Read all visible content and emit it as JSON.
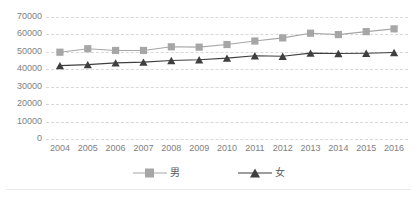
{
  "chart_data": {
    "type": "line",
    "title": "",
    "subtitle": "",
    "xlabel": "",
    "ylabel": "",
    "categories": [
      "2004",
      "2005",
      "2006",
      "2007",
      "2008",
      "2009",
      "2010",
      "2011",
      "2012",
      "2013",
      "2014",
      "2015",
      "2016"
    ],
    "series": [
      {
        "name": "男",
        "color": "#a6a6a6",
        "marker": "square",
        "values": [
          49800,
          51800,
          50800,
          50800,
          52900,
          52700,
          54200,
          56200,
          58000,
          60700,
          59900,
          61600,
          63200
        ]
      },
      {
        "name": "女",
        "color": "#3f3f3f",
        "marker": "triangle",
        "values": [
          42100,
          42700,
          43700,
          44100,
          45000,
          45500,
          46400,
          47800,
          47500,
          49300,
          49100,
          49200,
          49600
        ]
      }
    ],
    "ylim": [
      0,
      70000
    ],
    "y_ticks": [
      "0",
      "10000",
      "20000",
      "30000",
      "40000",
      "50000",
      "60000",
      "70000"
    ],
    "grid": true,
    "grid_style": "dashed-horizontal",
    "grid_color": "#d9d9d9",
    "legend_position": "bottom",
    "legend": [
      {
        "label": "男",
        "color": "#a6a6a6",
        "marker": "square"
      },
      {
        "label": "女",
        "color": "#3f3f3f",
        "marker": "triangle"
      }
    ],
    "axis_label_color": "#808080",
    "background": "#ffffff"
  }
}
